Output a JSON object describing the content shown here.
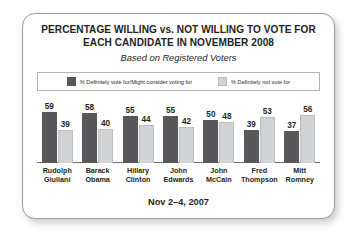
{
  "chart_data": {
    "type": "bar",
    "title": "PERCENTAGE WILLING vs. NOT WILLING TO VOTE FOR EACH CANDIDATE IN NOVEMBER 2008",
    "title_line1": "PERCENTAGE WILLING vs. NOT WILLING TO VOTE FOR",
    "title_line2": "EACH CANDIDATE IN NOVEMBER 2008",
    "subtitle": "Based on Registered Voters",
    "footnote": "Nov 2–4, 2007",
    "xlabel": "",
    "ylabel": "",
    "ylim": [
      0,
      60
    ],
    "grid": false,
    "legend_position": "top",
    "categories": [
      "Rudolph Giuliani",
      "Barack Obama",
      "Hillary Clinton",
      "John Edwards",
      "John McCain",
      "Fred Thompson",
      "Mitt Romney"
    ],
    "category_lines": [
      [
        "Rudolph",
        "Giuliani"
      ],
      [
        "Barack",
        "Obama"
      ],
      [
        "Hillary",
        "Clinton"
      ],
      [
        "John",
        "Edwards"
      ],
      [
        "John",
        "McCain"
      ],
      [
        "Fred",
        "Thompson"
      ],
      [
        "Mitt",
        "Romney"
      ]
    ],
    "series": [
      {
        "name": "% Definitely vote for/Might consider voting for",
        "color": "#58585a",
        "values": [
          59,
          58,
          55,
          55,
          50,
          39,
          37
        ]
      },
      {
        "name": "% Definitely not vote for",
        "color": "#d2d3d4",
        "values": [
          39,
          40,
          44,
          42,
          48,
          53,
          56
        ]
      }
    ]
  },
  "legend": {
    "items": [
      {
        "label": "% Definitely vote for/Might consider voting for",
        "swatch": "dark"
      },
      {
        "label": "% Definitely not vote for",
        "swatch": "light"
      }
    ]
  },
  "colors": {
    "bar_dark": "#58585a",
    "bar_light": "#d2d3d4",
    "text": "#231f20",
    "border": "#9a9a9a",
    "axis": "#6d6e70"
  }
}
